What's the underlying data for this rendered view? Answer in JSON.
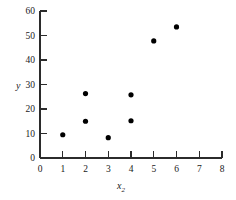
{
  "chart_data": {
    "type": "scatter",
    "title": "",
    "subtitle": "",
    "xlabel": "x2",
    "xlabel_base": "x",
    "xlabel_subscript": "2",
    "ylabel": "y",
    "xlim": [
      0,
      8
    ],
    "ylim": [
      0,
      60
    ],
    "xticks": [
      "0",
      "1",
      "2",
      "3",
      "4",
      "5",
      "6",
      "7",
      "8"
    ],
    "xtick_values": [
      0,
      1,
      2,
      3,
      4,
      5,
      6,
      7,
      8
    ],
    "yticks": [
      "0",
      "10",
      "20",
      "30",
      "40",
      "50",
      "60"
    ],
    "ytick_values": [
      0,
      10,
      20,
      30,
      40,
      50,
      60
    ],
    "grid": false,
    "legend": null,
    "marker": "filled-circle",
    "marker_color": "#000000",
    "points": [
      {
        "x": 1,
        "y": 9.5
      },
      {
        "x": 2,
        "y": 26.3
      },
      {
        "x": 2,
        "y": 15.0
      },
      {
        "x": 3,
        "y": 8.3
      },
      {
        "x": 4,
        "y": 25.8
      },
      {
        "x": 4,
        "y": 15.2
      },
      {
        "x": 5,
        "y": 47.8
      },
      {
        "x": 6,
        "y": 53.5
      }
    ],
    "x": [
      1,
      2,
      2,
      3,
      4,
      4,
      5,
      6
    ],
    "values": [
      9.5,
      26.3,
      15.0,
      8.3,
      25.8,
      15.2,
      47.8,
      53.5
    ]
  },
  "axis_colors": {
    "axis": "#2b2b2b",
    "text": "#1a1a1a",
    "marker": "#000000",
    "background": "#ffffff"
  }
}
